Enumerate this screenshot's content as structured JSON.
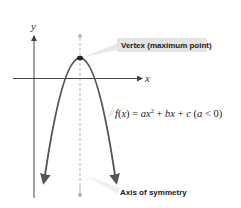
{
  "diagram": {
    "axes": {
      "x_label": "x",
      "y_label": "y"
    },
    "labels": {
      "vertex": "Vertex (maximum point)",
      "axis_of_symmetry": "Axis of symmetry",
      "formula": {
        "f": "f",
        "open": "(",
        "x": "x",
        "close": ")",
        "eq": " = ",
        "a": "a",
        "x2": "x",
        "sup": "2",
        "plus1": " + ",
        "b": "b",
        "x1": "x",
        "plus2": " + ",
        "c": "c",
        "cond_open": " (",
        "cond_a": "a",
        "cond_rest": " < 0)"
      }
    },
    "colors": {
      "curve": "#555555",
      "axes": "#444444",
      "symmetry_line": "#aaaaaa",
      "callout_bg": "#e4e4e4",
      "vertex_point": "#222222"
    }
  }
}
